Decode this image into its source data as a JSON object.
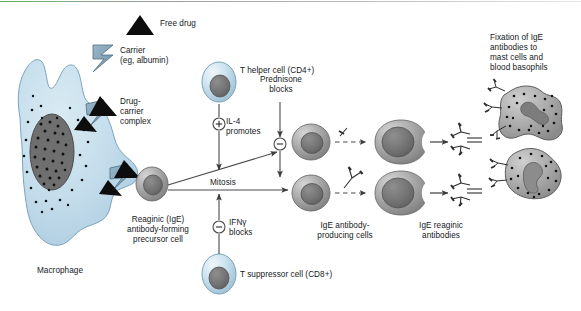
{
  "figure": {
    "topic": "IgE reaginic antibody formation pathway",
    "legend": {
      "free_drug": "Free drug",
      "carrier_line1": "Carrier",
      "carrier_line2": "(eg, albumin)",
      "complex_line1": "Drug-",
      "complex_line2": "carrier",
      "complex_line3": "complex"
    },
    "cells": {
      "macrophage": "Macrophage",
      "precursor_line1": "Reaginic (IgE)",
      "precursor_line2": "antibody-forming",
      "precursor_line3": "precursor cell",
      "t_helper": "T helper cell (CD4+)",
      "t_suppressor": "T suppressor cell (CD8+)",
      "producing_line1": "IgE antibody-",
      "producing_line2": "producing cells",
      "reaginic_line1": "IgE reaginic",
      "reaginic_line2": "antibodies"
    },
    "signals": {
      "il4_line1": "IL-4",
      "il4_line2": "promotes",
      "il4_sign": "+",
      "prednisone_line1": "Prednisone",
      "prednisone_line2": "blocks",
      "prednisone_sign": "−",
      "ifn_line1": "IFNγ",
      "ifn_line2": "blocks",
      "ifn_sign": "−",
      "mitosis": "Mitosis"
    },
    "fixation": {
      "line1": "Fixation of IgE",
      "line2": "antibodies to",
      "line3": "mast cells and",
      "line4": "blood basophils"
    },
    "colors": {
      "cytoplasm_blue": "#bcd7e4",
      "carrier_blue": "#7e9fb4",
      "drug_black": "#111111",
      "cell_gray": "#9b9b9b",
      "nucleus_gray": "#6e6e6e",
      "arrow_gray": "#4a4a4a",
      "text": "#15181a",
      "top_rule_green": "#5aa862"
    }
  }
}
